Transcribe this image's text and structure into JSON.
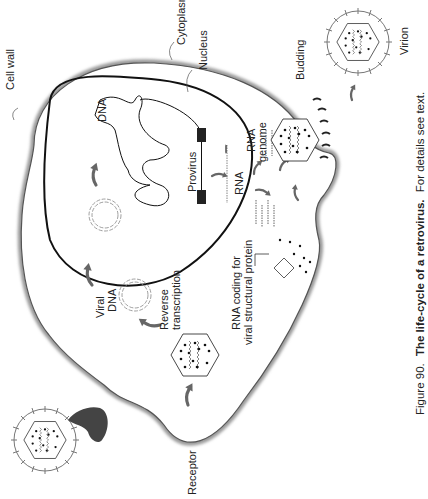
{
  "figure": {
    "caption_prefix": "Figure 90.",
    "caption_title": "The life-cycle of a retrovirus.",
    "caption_suffix": "For details see text.",
    "orientation": "rotated 90° counterclockwise"
  },
  "labels": {
    "cell_wall": "Cell wall",
    "cytoplasm": "Cytoplasm",
    "nucleus": "Nucleus",
    "dna": "DNA",
    "provirus": "Provirus",
    "rna": "RNA",
    "rna_genome_1": "RNA",
    "rna_genome_2": "genome",
    "budding": "Budding",
    "virion": "Virion",
    "viral_dna_1": "Viral",
    "viral_dna_2": "DNA",
    "reverse_1": "Reverse",
    "reverse_2": "transcription",
    "rna_coding_1": "RNA coding for",
    "rna_coding_2": "viral structural protein",
    "receptor": "Receptor"
  },
  "colors": {
    "line": "#111111",
    "arrow": "#666666",
    "receptor": "#444444",
    "cell_shadow": "#9a9a9a",
    "virion_outline": "#777777"
  }
}
